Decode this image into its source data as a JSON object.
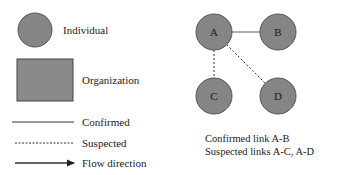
{
  "colors": {
    "node_fill": "#858585",
    "node_stroke": "#555555",
    "org_fill": "#8a8a8a",
    "org_stroke": "#444444",
    "line": "#333333",
    "link_line": "#7a7a7a"
  },
  "legend": {
    "individual": {
      "label": "Individual",
      "shape": "circle"
    },
    "organization": {
      "label": "Organization",
      "shape": "rectangle"
    },
    "confirmed": {
      "label": "Confirmed",
      "style": "solid"
    },
    "suspected": {
      "label": "Suspected",
      "style": "dashed"
    },
    "flow": {
      "label": "Flow direction",
      "style": "arrow"
    }
  },
  "network": {
    "nodes": [
      {
        "id": "A",
        "label": "A"
      },
      {
        "id": "B",
        "label": "B"
      },
      {
        "id": "C",
        "label": "C"
      },
      {
        "id": "D",
        "label": "D"
      }
    ],
    "links": [
      {
        "from": "A",
        "to": "B",
        "type": "confirmed"
      },
      {
        "from": "A",
        "to": "C",
        "type": "suspected"
      },
      {
        "from": "A",
        "to": "D",
        "type": "suspected"
      }
    ]
  },
  "caption": {
    "line1": "Confirmed link A-B",
    "line2": "Suspected links A-C, A-D"
  }
}
